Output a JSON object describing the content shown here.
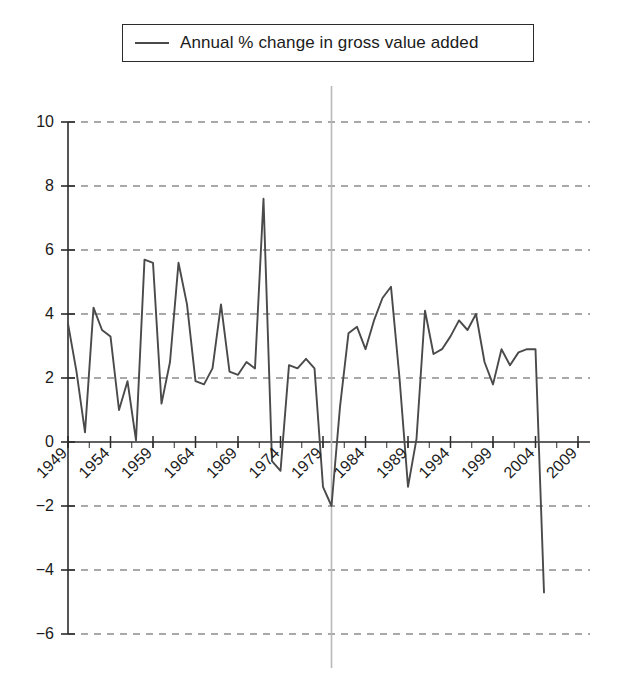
{
  "legend": {
    "entries": [
      {
        "label": "Annual % change in gross value added",
        "color": "#4a4a4a",
        "marker": "line-swatch"
      }
    ]
  },
  "axes": {
    "y_ticks": [
      "10",
      "8",
      "6",
      "4",
      "2",
      "0",
      "-2",
      "-4",
      "-6"
    ],
    "x_ticks": [
      "1949",
      "1954",
      "1959",
      "1964",
      "1969",
      "1974",
      "1979",
      "1984",
      "1989",
      "1994",
      "1999",
      "2004",
      "2009"
    ]
  },
  "annotations": {
    "vertical_marker_year": 1980,
    "vertical_marker_color": "#b8b8b8"
  },
  "chart_data": {
    "type": "line",
    "title": "",
    "xlabel": "",
    "ylabel": "",
    "xlim": [
      1949,
      2009
    ],
    "ylim": [
      -6,
      10
    ],
    "grid": true,
    "grid_style": "dashed-horizontal",
    "legend_position": "top-center",
    "line_color": "#4a4a4a",
    "x": [
      1949,
      1950,
      1951,
      1952,
      1953,
      1954,
      1955,
      1956,
      1957,
      1958,
      1959,
      1960,
      1961,
      1962,
      1963,
      1964,
      1965,
      1966,
      1967,
      1968,
      1969,
      1970,
      1971,
      1972,
      1973,
      1974,
      1975,
      1976,
      1977,
      1978,
      1979,
      1980,
      1981,
      1982,
      1983,
      1984,
      1985,
      1986,
      1987,
      1988,
      1989,
      1990,
      1991,
      1992,
      1993,
      1994,
      1995,
      1996,
      1997,
      1998,
      1999,
      2000,
      2001,
      2002,
      2003,
      2004,
      2005,
      2006,
      2007,
      2008,
      2009
    ],
    "series": [
      {
        "name": "Annual % change in gross value added",
        "values": [
          3.7,
          2.2,
          0.3,
          4.2,
          3.5,
          3.3,
          1.0,
          1.9,
          0.05,
          5.7,
          5.6,
          1.2,
          2.5,
          5.6,
          4.3,
          1.9,
          1.8,
          2.3,
          4.3,
          2.2,
          2.1,
          2.5,
          2.3,
          7.6,
          -0.6,
          -0.9,
          2.4,
          2.3,
          2.6,
          2.3,
          -1.4,
          -2.0,
          1.1,
          3.4,
          3.6,
          2.9,
          3.8,
          4.5,
          4.85,
          2.0,
          -1.4,
          0.1,
          4.1,
          2.75,
          2.9,
          3.3,
          3.8,
          3.5,
          4.0,
          2.5,
          1.8,
          2.9,
          2.4,
          2.8,
          2.9,
          2.9,
          -4.7,
          null,
          null,
          null,
          null
        ]
      }
    ]
  }
}
